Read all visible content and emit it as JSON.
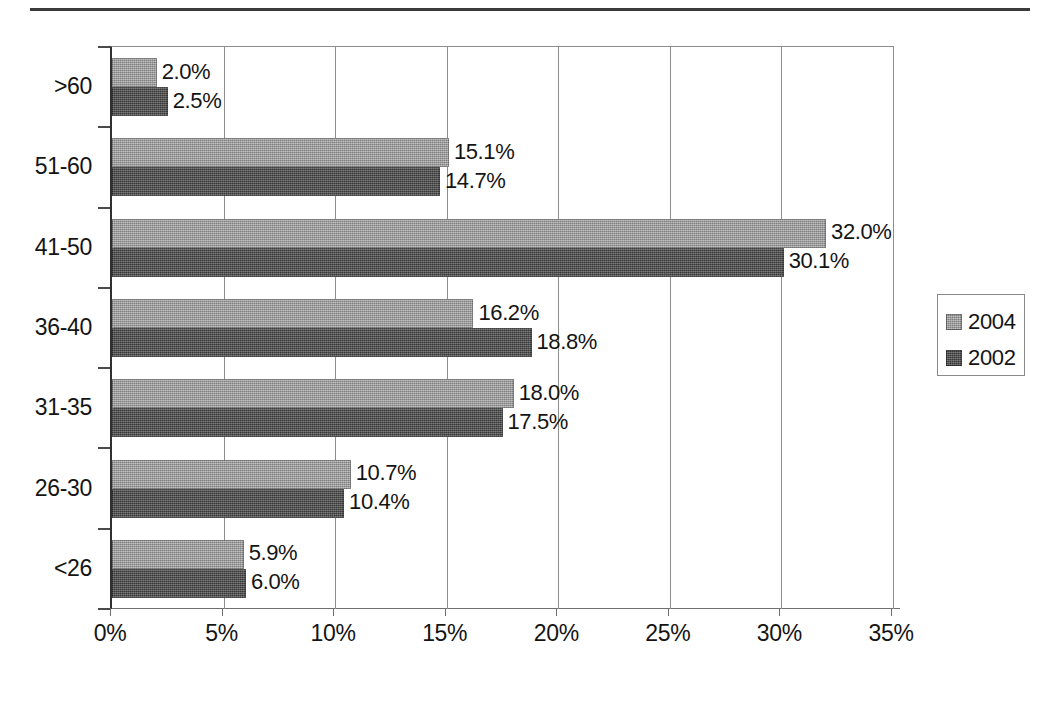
{
  "figure": {
    "top_rule": true,
    "background": "#ffffff",
    "colors": {
      "series_2004": "#9b9b9b",
      "series_2002": "#4c4c4c",
      "axis": "#2f2f2f",
      "gridline": "#8d8d8d",
      "text": "#141414"
    }
  },
  "chart_data": {
    "type": "bar",
    "orientation": "horizontal",
    "title": "",
    "subtitle": "",
    "xlabel": "",
    "ylabel": "",
    "categories": [
      ">60",
      "51-60",
      "41-50",
      "36-40",
      "31-35",
      "26-30",
      "<26"
    ],
    "series": [
      {
        "name": "2004",
        "color": "#9b9b9b",
        "values": [
          2.0,
          15.1,
          32.0,
          16.2,
          18.0,
          10.7,
          5.9
        ],
        "labels": [
          "2.0%",
          "15.1%",
          "32.0%",
          "16.2%",
          "18.0%",
          "10.7%",
          "5.9%"
        ]
      },
      {
        "name": "2002",
        "color": "#4c4c4c",
        "values": [
          2.5,
          14.7,
          30.1,
          18.8,
          17.5,
          10.4,
          6.0
        ],
        "labels": [
          "2.5%",
          "14.7%",
          "30.1%",
          "18.8%",
          "17.5%",
          "10.4%",
          "6.0%"
        ]
      }
    ],
    "xlim": [
      0,
      35
    ],
    "x_ticks": [
      0,
      5,
      10,
      15,
      20,
      25,
      30,
      35
    ],
    "x_tick_labels": [
      "0%",
      "5%",
      "10%",
      "15%",
      "20%",
      "25%",
      "30%",
      "35%"
    ],
    "grid": "vertical",
    "value_labels": true,
    "legend": {
      "position": "right",
      "entries": [
        "2004",
        "2002"
      ]
    }
  }
}
